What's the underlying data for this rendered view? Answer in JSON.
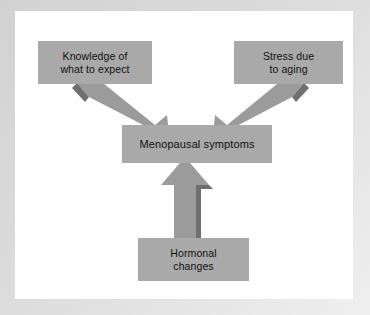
{
  "diagram": {
    "type": "flowchart",
    "colors": {
      "canvas_background": "#ffffff",
      "frame": "#d8d8d8",
      "node_fill": "#a9a9a9",
      "node_text": "#111111",
      "arrow_fill": "#9b9b9b",
      "arrow_shadow": "#6f6f6f"
    },
    "nodes": [
      {
        "id": "knowledge",
        "label": "Knowledge of\nwhat to expect",
        "position": "top-left"
      },
      {
        "id": "stress",
        "label": "Stress due\nto aging",
        "position": "top-right"
      },
      {
        "id": "menopausal",
        "label": "Menopausal symptoms",
        "position": "center"
      },
      {
        "id": "hormonal",
        "label": "Hormonal\nchanges",
        "position": "bottom-center"
      }
    ],
    "edges": [
      {
        "id": "knowledge-to-menopausal",
        "from": "knowledge",
        "to": "menopausal",
        "direction": "down-right",
        "style": "block-arrow"
      },
      {
        "id": "stress-to-menopausal",
        "from": "stress",
        "to": "menopausal",
        "direction": "down-left",
        "style": "block-arrow"
      },
      {
        "id": "hormonal-to-menopausal",
        "from": "hormonal",
        "to": "menopausal",
        "direction": "up",
        "style": "block-arrow"
      }
    ]
  }
}
